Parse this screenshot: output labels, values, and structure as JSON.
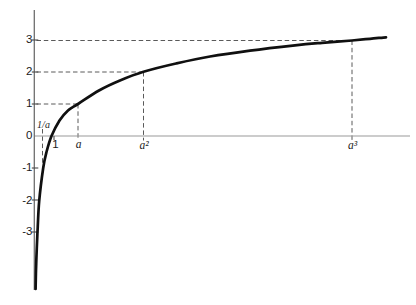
{
  "figure_colors": {
    "background": "#ffffff",
    "x_axis": "#9a9a9a",
    "y_axis": "#6e6e6e",
    "tick": "#4a4a4a",
    "dash": "#5a5a5a",
    "curve": "#101010",
    "label": "#1b1b1b"
  },
  "chart_data": {
    "type": "line",
    "title": "",
    "xlabel": "",
    "ylabel": "",
    "series": [
      {
        "name": "logarithmic curve through labeled points",
        "points": [
          {
            "x": "1/a",
            "y": -1
          },
          {
            "x": "1",
            "y": 0
          },
          {
            "x": "a",
            "y": 1
          },
          {
            "x": "a²",
            "y": 2
          },
          {
            "x": "a³",
            "y": 3
          }
        ]
      }
    ],
    "x_tick_labels": [
      "1/a",
      "1",
      "a",
      "a²",
      "a³"
    ],
    "y_tick_labels": [
      "3",
      "2",
      "1",
      "0",
      "-1",
      "-2",
      "-3"
    ],
    "ylim": [
      -3.9,
      3.9
    ],
    "grid": false,
    "legend": "none",
    "guides": "dashed segments join (1/a,-1), (a,1), (a²,2), (a³,3) to the x and y axes; curve is asymptotic to the negative y-axis",
    "layout": {
      "canvas": {
        "width": 416,
        "height": 305
      },
      "x_axis": {
        "y": 136,
        "x1": 34.3,
        "x2": 410
      },
      "y_axis": {
        "x": 34.3,
        "top": 10,
        "bottom": 290
      },
      "y_ticks": [
        40,
        72,
        104,
        168,
        200,
        232
      ],
      "y_tick_span": [
        31.8,
        38.3
      ],
      "x_ticks": [
        [
          54,
          136,
          54,
          140.3
        ]
      ],
      "dash_pattern": "4.5 2.8",
      "guide_lines": [
        {
          "name": "guide-h-y3",
          "c": [
            36.5,
            40.5,
            352,
            40.5
          ]
        },
        {
          "name": "guide-h-y2",
          "c": [
            36.5,
            72,
            143.5,
            72
          ]
        },
        {
          "name": "guide-h-y1",
          "c": [
            36.5,
            104,
            78,
            104
          ]
        },
        {
          "name": "guide-v-a",
          "c": [
            78,
            104,
            78,
            140.5
          ]
        },
        {
          "name": "guide-v-a2",
          "c": [
            143.5,
            72,
            143.5,
            140.5
          ]
        },
        {
          "name": "guide-v-a3",
          "c": [
            352,
            40.5,
            352,
            140.5
          ]
        },
        {
          "name": "guide-v-1-over-a",
          "c": [
            42.5,
            129,
            42.5,
            163.5
          ]
        }
      ],
      "curve_pixels": [
        [
          35.6,
          289
        ],
        [
          35.9,
          274
        ],
        [
          36.4,
          258
        ],
        [
          37.3,
          236
        ],
        [
          37.7,
          228
        ],
        [
          39.2,
          201
        ],
        [
          43.2,
          168
        ],
        [
          46.5,
          152
        ],
        [
          51.5,
          136
        ],
        [
          59.5,
          120.5
        ],
        [
          68,
          110.5
        ],
        [
          78,
          104
        ],
        [
          99,
          90.5
        ],
        [
          120,
          80.5
        ],
        [
          143.5,
          71.8
        ],
        [
          176,
          63.5
        ],
        [
          210,
          56.5
        ],
        [
          250,
          50.6
        ],
        [
          295,
          45.3
        ],
        [
          322,
          42.8
        ],
        [
          352,
          40.5
        ],
        [
          370,
          38.8
        ],
        [
          386,
          37.3
        ]
      ],
      "labels": [
        {
          "name": "y-axis-label-3",
          "text": "3",
          "x": 32.5,
          "y": 40,
          "cls": "num right"
        },
        {
          "name": "y-axis-label-2",
          "text": "2",
          "x": 32.5,
          "y": 72,
          "cls": "num right"
        },
        {
          "name": "y-axis-label-1",
          "text": "1",
          "x": 32.5,
          "y": 104,
          "cls": "num right"
        },
        {
          "name": "y-axis-label-0",
          "text": "0",
          "x": 32.5,
          "y": 135.5,
          "cls": "num right"
        },
        {
          "name": "y-axis-label-neg-1",
          "text": "-1",
          "x": 32.5,
          "y": 168,
          "cls": "num right"
        },
        {
          "name": "y-axis-label-neg-2",
          "text": "-2",
          "x": 32.5,
          "y": 200.5,
          "cls": "num right"
        },
        {
          "name": "y-axis-label-neg-3",
          "text": "-3",
          "x": 32.5,
          "y": 232,
          "cls": "num right"
        },
        {
          "name": "x-axis-label-1-over-a",
          "text": "1/a",
          "x": 43.5,
          "y": 124.5,
          "cls": "frac"
        },
        {
          "name": "x-axis-label-1",
          "text": "1",
          "x": 55.5,
          "y": 144.5,
          "cls": "num"
        },
        {
          "name": "x-axis-label-a",
          "text": "a",
          "x": 78.5,
          "y": 145,
          "cls": "var"
        },
        {
          "name": "x-axis-label-a-squared",
          "text": "a²",
          "x": 144,
          "y": 145.5,
          "cls": "var"
        },
        {
          "name": "x-axis-label-a-cubed",
          "text": "a³",
          "x": 352.5,
          "y": 145.5,
          "cls": "var"
        }
      ]
    }
  }
}
